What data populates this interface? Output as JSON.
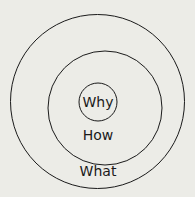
{
  "diagram": {
    "background": "#ecece7",
    "stroke": "#1a1a1a",
    "rings": [
      {
        "name": "why",
        "label": "Why",
        "cx": 98,
        "cy": 102,
        "r": 19
      },
      {
        "name": "how",
        "label": "How",
        "cx": 105,
        "cy": 108,
        "r": 57
      },
      {
        "name": "what",
        "label": "What",
        "cx": 98,
        "cy": 102,
        "r": 87
      }
    ],
    "labels": {
      "why": "Why",
      "how": "How",
      "what": "What"
    }
  }
}
